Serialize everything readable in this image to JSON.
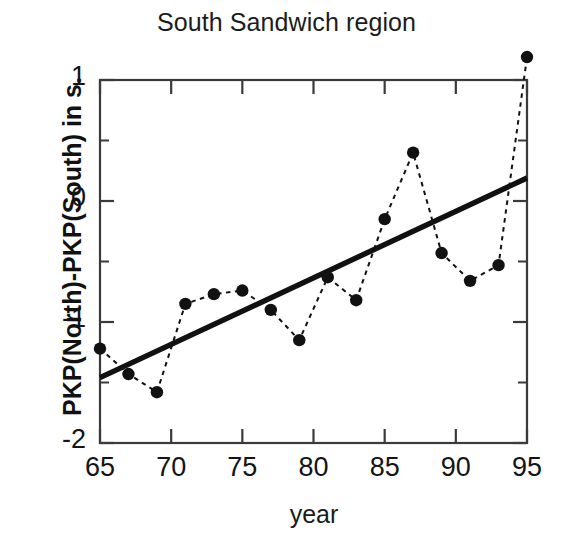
{
  "chart_data": {
    "type": "scatter",
    "title": "South Sandwich region",
    "xlabel": "year",
    "ylabel": "PKP(North)-PKP(South) in s.",
    "xlim": [
      65,
      95
    ],
    "ylim": [
      -2,
      1
    ],
    "xticks": [
      65,
      70,
      75,
      80,
      85,
      90,
      95
    ],
    "xtick_labels": [
      "65",
      "70",
      "75",
      "80",
      "85",
      "90",
      "95"
    ],
    "yticks": [
      1,
      0,
      -1,
      -2
    ],
    "ytick_labels": [
      "1",
      "0",
      "-1",
      "-2"
    ],
    "yminorticks": [
      0.5,
      -0.5,
      -1.5
    ],
    "grid": false,
    "legend": null,
    "series": [
      {
        "name": "PKP(North)-PKP(South) observations",
        "style": "dotted-line-with-filled-circles",
        "color": "#111111",
        "x": [
          65,
          67,
          69,
          71,
          73,
          75,
          77,
          79,
          81,
          83,
          85,
          87,
          89,
          91,
          93,
          95
        ],
        "values": [
          -1.22,
          -1.43,
          -1.58,
          -0.85,
          -0.77,
          -0.74,
          -0.9,
          -1.15,
          -0.63,
          -0.82,
          -0.15,
          0.4,
          -0.43,
          -0.66,
          -0.53,
          1.19
        ]
      },
      {
        "name": "linear trend",
        "style": "solid-thick-line",
        "color": "#111111",
        "x": [
          65,
          95
        ],
        "values": [
          -1.46,
          0.19
        ]
      }
    ]
  },
  "figure": {
    "background_color": "#ffffff",
    "axis_color": "#3a3a3a",
    "marker_color": "#111111"
  }
}
